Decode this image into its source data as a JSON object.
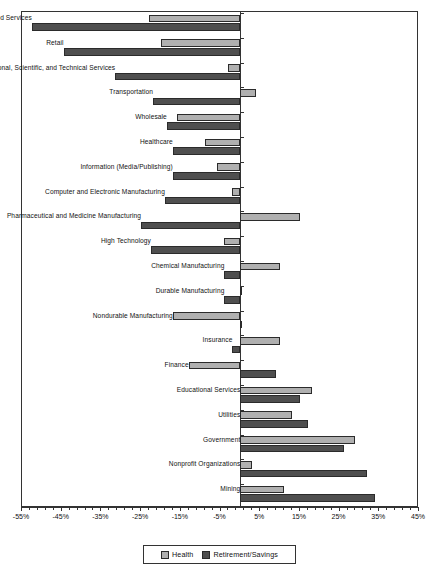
{
  "chart_data": {
    "type": "bar",
    "orientation": "horizontal",
    "title": "",
    "subtitle": "",
    "xlabel": "",
    "ylabel": "",
    "xlim": [
      -55,
      45
    ],
    "xticks": [
      -55,
      -45,
      -35,
      -25,
      -15,
      -5,
      5,
      15,
      25,
      35,
      45
    ],
    "xticklabels": [
      "-55%",
      "-45%",
      "-35%",
      "-25%",
      "-15%",
      "-5%",
      "5%",
      "15%",
      "25%",
      "35%",
      "45%"
    ],
    "xtick_minor_step": 2,
    "grid": false,
    "legend_position": "bottom-center",
    "zero_line": 0,
    "categories": [
      "Accommodation and Food Services",
      "Retail",
      "Professional, Scientific, and Technical Services",
      "Transportation",
      "Wholesale",
      "Healthcare",
      "Information (Media/Publishing)",
      "Computer and Electronic Manufacturing",
      "Pharmaceutical and Medicine Manufacturing",
      "High Technology",
      "Chemical Manufacturing",
      "Durable Manufacturing",
      "Nondurable Manufacturing",
      "Insurance",
      "Finance",
      "Educational Services",
      "Utilities",
      "Government",
      "Nonprofit Organizations",
      "Mining"
    ],
    "series": [
      {
        "name": "Health",
        "color": "#b0b0b0",
        "values": [
          -23,
          -20,
          -3,
          4,
          -16,
          -9,
          -6,
          -2,
          15,
          -4,
          10,
          0.5,
          -17,
          10,
          -13,
          18,
          13,
          29,
          3,
          11
        ]
      },
      {
        "name": "Retirement/Savings",
        "color": "#4f4f4f",
        "values": [
          -52.5,
          -44.5,
          -31.5,
          -22,
          -18.5,
          -17,
          -17,
          -19,
          -25,
          -22.5,
          -4,
          -4,
          0,
          -2,
          9,
          15,
          17,
          26,
          32,
          34
        ]
      }
    ]
  },
  "legend": {
    "items": [
      {
        "label": "Health",
        "color": "#b0b0b0"
      },
      {
        "label": "Retirement/Savings",
        "color": "#4f4f4f"
      }
    ]
  }
}
